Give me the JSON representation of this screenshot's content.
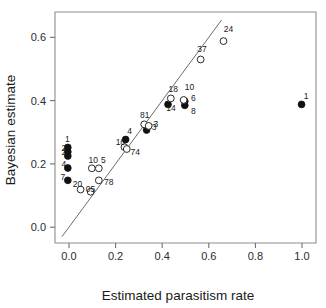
{
  "chart_data": {
    "type": "scatter",
    "title": "",
    "xlabel": "Estimated parasitism rate",
    "ylabel": "Bayesian estimate",
    "xlim": [
      -0.06,
      1.06
    ],
    "ylim": [
      -0.05,
      0.68
    ],
    "xticks": [
      0.0,
      0.2,
      0.4,
      0.6,
      0.8,
      1.0
    ],
    "xticklabels": [
      "0.0",
      "0.2",
      "0.4",
      "0.6",
      "0.8",
      "1.0"
    ],
    "yticks": [
      0.0,
      0.2,
      0.4,
      0.6
    ],
    "yticklabels": [
      "0.0",
      "0.2",
      "0.4",
      "0.6"
    ],
    "grid": false,
    "legend": "none",
    "reference_line": {
      "name": "identity-line",
      "type": "line",
      "slope": 1.0,
      "intercept": 0.0,
      "x_from": -0.03,
      "x_to": 0.655
    },
    "series": [
      {
        "name": "Filled circles",
        "marker": "filled-circle",
        "points": [
          {
            "x": -0.005,
            "y": 0.252,
            "label": "1"
          },
          {
            "x": -0.005,
            "y": 0.238,
            "label": "2"
          },
          {
            "x": -0.005,
            "y": 0.225,
            "label": "2"
          },
          {
            "x": -0.005,
            "y": 0.187,
            "label": "4"
          },
          {
            "x": -0.005,
            "y": 0.148,
            "label": "7"
          },
          {
            "x": 0.243,
            "y": 0.277,
            "label": "4"
          },
          {
            "x": 0.333,
            "y": 0.307,
            "label": "3"
          },
          {
            "x": 0.425,
            "y": 0.388,
            "label": "14"
          },
          {
            "x": 0.497,
            "y": 0.398,
            "label": "6"
          },
          {
            "x": 0.497,
            "y": 0.385,
            "label": "8"
          },
          {
            "x": 0.998,
            "y": 0.388,
            "label": "1"
          }
        ]
      },
      {
        "name": "Open circles",
        "marker": "open-circle",
        "points": [
          {
            "x": 0.098,
            "y": 0.186,
            "label": "10"
          },
          {
            "x": 0.128,
            "y": 0.186,
            "label": "5"
          },
          {
            "x": 0.05,
            "y": 0.119,
            "label": "20"
          },
          {
            "x": 0.093,
            "y": 0.112,
            "label": "05"
          },
          {
            "x": 0.128,
            "y": 0.148,
            "label": "78"
          },
          {
            "x": 0.238,
            "y": 0.253,
            "label": "16"
          },
          {
            "x": 0.248,
            "y": 0.247,
            "label": "74"
          },
          {
            "x": 0.323,
            "y": 0.325,
            "label": "81"
          },
          {
            "x": 0.342,
            "y": 0.32,
            "label": "3"
          },
          {
            "x": 0.437,
            "y": 0.407,
            "label": "18"
          },
          {
            "x": 0.492,
            "y": 0.402,
            "label": "10"
          },
          {
            "x": 0.565,
            "y": 0.53,
            "label": "37"
          },
          {
            "x": 0.663,
            "y": 0.588,
            "label": "24"
          }
        ]
      }
    ]
  }
}
